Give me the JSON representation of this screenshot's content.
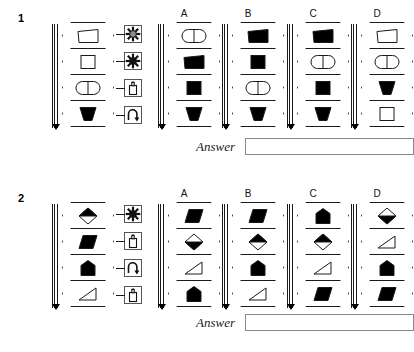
{
  "page": {
    "background": "#ffffff",
    "ink": "#1a1a1a",
    "fill": "#000000"
  },
  "option_labels": [
    "A",
    "B",
    "C",
    "D"
  ],
  "answer": {
    "label": "Answer",
    "value": "",
    "placeholder": ""
  },
  "puzzles": [
    {
      "number": "1",
      "stem": {
        "name": "stem-stack-1",
        "cells": [
          {
            "shape": "trapezoid",
            "fill": "outline"
          },
          {
            "shape": "square",
            "fill": "outline"
          },
          {
            "shape": "oval-split",
            "fill": "outline"
          },
          {
            "shape": "funnel",
            "fill": "solid"
          }
        ],
        "operators": [
          {
            "icon": "starburst-gray-icon",
            "name": "operator-starburst-gray"
          },
          {
            "icon": "starburst-black-icon",
            "name": "operator-starburst-black"
          },
          {
            "icon": "flask-icon",
            "name": "operator-flask"
          },
          {
            "icon": "rotate-arrow-icon",
            "name": "operator-rotate"
          }
        ]
      },
      "options": [
        {
          "label": "A",
          "cells": [
            {
              "shape": "oval-split",
              "fill": "outline"
            },
            {
              "shape": "trapezoid",
              "fill": "solid"
            },
            {
              "shape": "square",
              "fill": "solid"
            },
            {
              "shape": "funnel",
              "fill": "solid"
            }
          ]
        },
        {
          "label": "B",
          "cells": [
            {
              "shape": "trapezoid",
              "fill": "solid"
            },
            {
              "shape": "square",
              "fill": "solid"
            },
            {
              "shape": "oval-split",
              "fill": "outline"
            },
            {
              "shape": "funnel",
              "fill": "solid"
            }
          ]
        },
        {
          "label": "C",
          "cells": [
            {
              "shape": "trapezoid",
              "fill": "solid"
            },
            {
              "shape": "oval-split",
              "fill": "outline"
            },
            {
              "shape": "square",
              "fill": "solid"
            },
            {
              "shape": "funnel",
              "fill": "solid"
            }
          ]
        },
        {
          "label": "D",
          "cells": [
            {
              "shape": "trapezoid",
              "fill": "outline"
            },
            {
              "shape": "oval-split",
              "fill": "outline"
            },
            {
              "shape": "funnel",
              "fill": "solid"
            },
            {
              "shape": "square",
              "fill": "outline"
            }
          ]
        }
      ]
    },
    {
      "number": "2",
      "stem": {
        "name": "stem-stack-2",
        "cells": [
          {
            "shape": "diamond-split-top",
            "fill": "half"
          },
          {
            "shape": "parallelogram",
            "fill": "solid"
          },
          {
            "shape": "pentagon",
            "fill": "solid"
          },
          {
            "shape": "triangle",
            "fill": "outline"
          }
        ],
        "operators": [
          {
            "icon": "starburst-black-icon",
            "name": "operator-starburst-black"
          },
          {
            "icon": "flask-icon",
            "name": "operator-flask"
          },
          {
            "icon": "rotate-arrow-icon",
            "name": "operator-rotate"
          },
          {
            "icon": "flask-icon",
            "name": "operator-flask"
          }
        ]
      },
      "options": [
        {
          "label": "A",
          "cells": [
            {
              "shape": "parallelogram",
              "fill": "solid"
            },
            {
              "shape": "diamond-split-bottom",
              "fill": "half"
            },
            {
              "shape": "triangle",
              "fill": "outline"
            },
            {
              "shape": "pentagon",
              "fill": "solid"
            }
          ]
        },
        {
          "label": "B",
          "cells": [
            {
              "shape": "parallelogram",
              "fill": "solid"
            },
            {
              "shape": "diamond-split-top",
              "fill": "half"
            },
            {
              "shape": "pentagon",
              "fill": "solid"
            },
            {
              "shape": "triangle",
              "fill": "outline"
            }
          ]
        },
        {
          "label": "C",
          "cells": [
            {
              "shape": "pentagon",
              "fill": "solid"
            },
            {
              "shape": "diamond-split-top",
              "fill": "half"
            },
            {
              "shape": "triangle",
              "fill": "outline"
            },
            {
              "shape": "parallelogram",
              "fill": "solid"
            }
          ]
        },
        {
          "label": "D",
          "cells": [
            {
              "shape": "diamond-split-bottom",
              "fill": "half"
            },
            {
              "shape": "triangle",
              "fill": "outline"
            },
            {
              "shape": "pentagon",
              "fill": "solid"
            },
            {
              "shape": "parallelogram",
              "fill": "solid"
            }
          ]
        }
      ]
    }
  ]
}
